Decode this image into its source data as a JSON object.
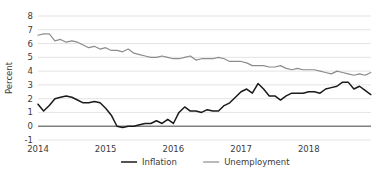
{
  "chart_data": {
    "type": "line",
    "title": "",
    "xlabel": "",
    "ylabel": "Percent",
    "ylim": [
      -1,
      8
    ],
    "xlim": [
      2014.0,
      2018.92
    ],
    "grid": true,
    "legend_position": "bottom-center",
    "yticks": [
      "8",
      "7",
      "6",
      "5",
      "4",
      "3",
      "2",
      "1",
      "0",
      "-1"
    ],
    "ytick_values": [
      8,
      7,
      6,
      5,
      4,
      3,
      2,
      1,
      0,
      -1
    ],
    "xticks": [
      "2014",
      "2015",
      "2016",
      "2017",
      "2018"
    ],
    "xtick_values": [
      2014,
      2015,
      2016,
      2017,
      2018
    ],
    "series": [
      {
        "name": "Inflation",
        "color": "#1a1a1a",
        "x": [
          2014.0,
          2014.083,
          2014.167,
          2014.25,
          2014.333,
          2014.417,
          2014.5,
          2014.583,
          2014.667,
          2014.75,
          2014.833,
          2014.917,
          2015.0,
          2015.083,
          2015.167,
          2015.25,
          2015.333,
          2015.417,
          2015.5,
          2015.583,
          2015.667,
          2015.75,
          2015.833,
          2015.917,
          2016.0,
          2016.083,
          2016.167,
          2016.25,
          2016.333,
          2016.417,
          2016.5,
          2016.583,
          2016.667,
          2016.75,
          2016.833,
          2016.917,
          2017.0,
          2017.083,
          2017.167,
          2017.25,
          2017.333,
          2017.417,
          2017.5,
          2017.583,
          2017.667,
          2017.75,
          2017.833,
          2017.917,
          2018.0,
          2018.083,
          2018.167,
          2018.25,
          2018.333,
          2018.417,
          2018.5,
          2018.583,
          2018.667,
          2018.75,
          2018.833,
          2018.917
        ],
        "values": [
          1.6,
          1.1,
          1.5,
          2.0,
          2.1,
          2.2,
          2.1,
          1.9,
          1.7,
          1.7,
          1.8,
          1.7,
          1.3,
          0.8,
          0.0,
          -0.1,
          0.0,
          0.0,
          0.1,
          0.2,
          0.2,
          0.4,
          0.2,
          0.5,
          0.2,
          1.0,
          1.4,
          1.1,
          1.1,
          1.0,
          1.2,
          1.1,
          1.1,
          1.5,
          1.7,
          2.1,
          2.5,
          2.7,
          2.4,
          3.1,
          2.7,
          2.2,
          2.2,
          1.9,
          2.2,
          2.4,
          2.4,
          2.4,
          2.5,
          2.5,
          2.4,
          2.7,
          2.8,
          2.9,
          3.2,
          3.2,
          2.7,
          2.9,
          2.6,
          2.3
        ]
      },
      {
        "name": "Unemployment",
        "color": "#8c8c8c",
        "x": [
          2014.0,
          2014.083,
          2014.167,
          2014.25,
          2014.333,
          2014.417,
          2014.5,
          2014.583,
          2014.667,
          2014.75,
          2014.833,
          2014.917,
          2015.0,
          2015.083,
          2015.167,
          2015.25,
          2015.333,
          2015.417,
          2015.5,
          2015.583,
          2015.667,
          2015.75,
          2015.833,
          2015.917,
          2016.0,
          2016.083,
          2016.167,
          2016.25,
          2016.333,
          2016.417,
          2016.5,
          2016.583,
          2016.667,
          2016.75,
          2016.833,
          2016.917,
          2017.0,
          2017.083,
          2017.167,
          2017.25,
          2017.333,
          2017.417,
          2017.5,
          2017.583,
          2017.667,
          2017.75,
          2017.833,
          2017.917,
          2018.0,
          2018.083,
          2018.167,
          2018.25,
          2018.333,
          2018.417,
          2018.5,
          2018.583,
          2018.667,
          2018.75,
          2018.833,
          2018.917
        ],
        "values": [
          6.6,
          6.7,
          6.7,
          6.2,
          6.3,
          6.1,
          6.2,
          6.1,
          5.9,
          5.7,
          5.8,
          5.6,
          5.7,
          5.5,
          5.5,
          5.4,
          5.6,
          5.3,
          5.2,
          5.1,
          5.0,
          5.0,
          5.1,
          5.0,
          4.9,
          4.9,
          5.0,
          5.1,
          4.8,
          4.9,
          4.9,
          4.9,
          5.0,
          4.9,
          4.7,
          4.7,
          4.7,
          4.6,
          4.4,
          4.4,
          4.4,
          4.3,
          4.3,
          4.4,
          4.2,
          4.1,
          4.2,
          4.1,
          4.1,
          4.1,
          4.0,
          3.9,
          3.8,
          4.0,
          3.9,
          3.8,
          3.7,
          3.8,
          3.7,
          3.9
        ]
      }
    ],
    "legend": [
      {
        "label": "Inflation",
        "color": "#1a1a1a",
        "width": 1.5
      },
      {
        "label": "Unemployment",
        "color": "#8c8c8c",
        "width": 1.2
      }
    ]
  }
}
